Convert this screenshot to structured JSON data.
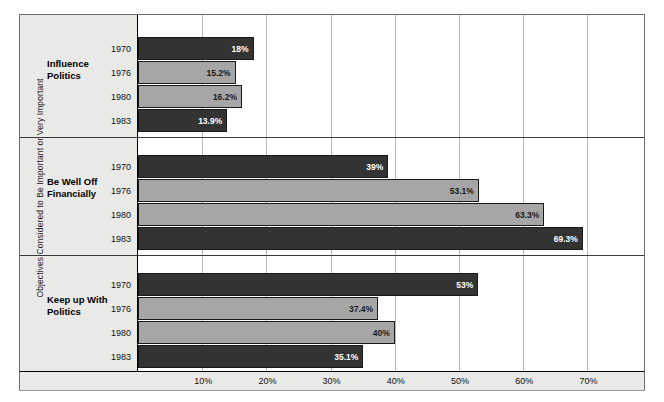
{
  "chart_data": {
    "type": "bar",
    "orientation": "horizontal",
    "title": "",
    "xlabel": "",
    "ylabel": "Objectives Considered to Be Important or Very Important",
    "xlim": [
      0,
      73
    ],
    "grid": true,
    "legend": "none",
    "xticks": [
      "10%",
      "20%",
      "30%",
      "40%",
      "50%",
      "60%",
      "70%"
    ],
    "xtick_values": [
      10,
      20,
      30,
      40,
      50,
      60,
      70
    ],
    "categories": [
      "Influence Politics",
      "Be Well Off Financially",
      "Keep up With Politics"
    ],
    "series_labels": [
      "1970",
      "1976",
      "1980",
      "1983"
    ],
    "groups": [
      {
        "name": "Influence\nPolitics",
        "name_line1": "Influence",
        "name_line2": "Politics",
        "bars": [
          {
            "year": "1970",
            "value": 18,
            "label": "18%",
            "shade": "dark"
          },
          {
            "year": "1976",
            "value": 15.2,
            "label": "15.2%",
            "shade": "light"
          },
          {
            "year": "1980",
            "value": 16.2,
            "label": "16.2%",
            "shade": "light"
          },
          {
            "year": "1983",
            "value": 13.9,
            "label": "13.9%",
            "shade": "dark"
          }
        ]
      },
      {
        "name": "Be Well Off\nFinancially",
        "name_line1": "Be Well Off",
        "name_line2": "Financially",
        "bars": [
          {
            "year": "1970",
            "value": 39,
            "label": "39%",
            "shade": "dark"
          },
          {
            "year": "1976",
            "value": 53.1,
            "label": "53.1%",
            "shade": "light"
          },
          {
            "year": "1980",
            "value": 63.3,
            "label": "63.3%",
            "shade": "light"
          },
          {
            "year": "1983",
            "value": 69.3,
            "label": "69.3%",
            "shade": "dark"
          }
        ]
      },
      {
        "name": "Keep up With\nPolitics",
        "name_line1": "Keep up With",
        "name_line2": "Politics",
        "bars": [
          {
            "year": "1970",
            "value": 53,
            "label": "53%",
            "shade": "dark"
          },
          {
            "year": "1976",
            "value": 37.4,
            "label": "37.4%",
            "shade": "light"
          },
          {
            "year": "1980",
            "value": 40,
            "label": "40%",
            "shade": "light"
          },
          {
            "year": "1983",
            "value": 35.1,
            "label": "35.1%",
            "shade": "dark"
          }
        ]
      }
    ],
    "colors": {
      "dark_bar": "#333333",
      "light_bar": "#a6a6a6",
      "panel": "#e9e9e7",
      "grid": "#b9b9b9",
      "frame": "#6b6b6b",
      "text": "#111111"
    }
  }
}
